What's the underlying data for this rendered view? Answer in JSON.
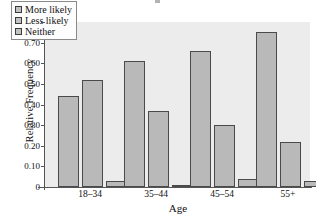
{
  "chart_data": {
    "type": "bar",
    "title": "",
    "xlabel": "Age",
    "ylabel": "Relative Frequency",
    "categories": [
      "18–34",
      "35–44",
      "45–54",
      "55+"
    ],
    "series": [
      {
        "name": "More likely",
        "values": [
          0.44,
          0.61,
          0.66,
          0.75
        ]
      },
      {
        "name": "Less likely",
        "values": [
          0.52,
          0.37,
          0.3,
          0.22
        ]
      },
      {
        "name": "Neither",
        "values": [
          0.03,
          0.01,
          0.04,
          0.03
        ]
      }
    ],
    "ylim": [
      0,
      0.8
    ],
    "ytick_labels": [
      "0.80",
      "0.70",
      "0.60",
      "0.50",
      "0.40",
      "0.30",
      "0.20",
      "0.10",
      "0"
    ],
    "ytick_values": [
      0.8,
      0.7,
      0.6,
      0.5,
      0.4,
      0.3,
      0.2,
      0.1,
      0
    ],
    "grid": false,
    "legend_position": "top-left",
    "colors": {
      "bar_fill": "#b9b9b9",
      "bar_edge": "#4a4a4a",
      "plot_background": "#ececec",
      "figure_background": "#ffffff",
      "axis": "#555555",
      "text": "#111111"
    }
  },
  "legend": {
    "items": [
      {
        "label": "More likely"
      },
      {
        "label": "Less likely"
      },
      {
        "label": "Neither"
      }
    ]
  }
}
